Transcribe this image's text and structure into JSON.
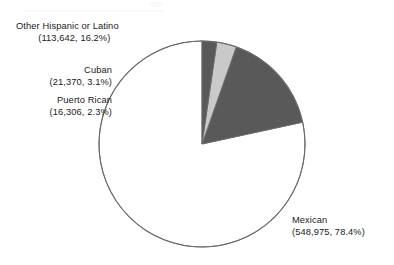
{
  "chart_data": {
    "type": "pie",
    "title": "",
    "subtitle": "",
    "xlabel": "",
    "ylabel": "",
    "legend_position": "none",
    "grid": false,
    "start_angle_deg": 90,
    "direction": "counterclockwise",
    "total": 700293,
    "categories": [
      "Mexican",
      "Other Hispanic or Latino",
      "Cuban",
      "Puerto Rican"
    ],
    "values": [
      548975,
      113642,
      21370,
      16306
    ],
    "percentages": [
      78.4,
      16.2,
      3.1,
      2.3
    ],
    "colors": [
      "#ffffff",
      "#595959",
      "#c9c9c9",
      "#595959"
    ],
    "slices": [
      {
        "name": "Mexican",
        "value": 548975,
        "value_label": "548,975",
        "percent": 78.4,
        "percent_label": "78.4%",
        "color": "#ffffff",
        "label_line1": "Mexican",
        "label_line2": "(548,975, 78.4%)"
      },
      {
        "name": "Other Hispanic or Latino",
        "value": 113642,
        "value_label": "113,642",
        "percent": 16.2,
        "percent_label": "16.2%",
        "color": "#595959",
        "label_line1": "Other Hispanic or Latino",
        "label_line2": "(113,642, 16.2%)"
      },
      {
        "name": "Cuban",
        "value": 21370,
        "value_label": "21,370",
        "percent": 3.1,
        "percent_label": "3.1%",
        "color": "#c9c9c9",
        "label_line1": "Cuban",
        "label_line2": "(21,370, 3.1%)"
      },
      {
        "name": "Puerto Rican",
        "value": 16306,
        "value_label": "16,306",
        "percent": 2.3,
        "percent_label": "2.3%",
        "color": "#595959",
        "label_line1": "Puerto Rican",
        "label_line2": "(16,306, 2.3%)"
      }
    ]
  },
  "geometry": {
    "center_x": 202,
    "center_y": 144,
    "radius": 103,
    "outline_color": "#6b6b6b"
  }
}
